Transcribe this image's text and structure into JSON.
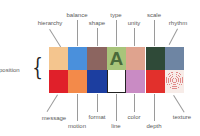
{
  "diagram": {
    "group_label": "composition",
    "group_label_visible": "mposition",
    "top_row": [
      {
        "label": "hierarchy",
        "color": "#f4c58e"
      },
      {
        "label": "balance",
        "color": "#4a90dc"
      },
      {
        "label": "shape",
        "color": "#8c6560"
      },
      {
        "label": "type",
        "color": "#a8c47a",
        "glyph": "A"
      },
      {
        "label": "unity",
        "color": "#dfa38e"
      },
      {
        "label": "scale",
        "color": "#2f4a38"
      },
      {
        "label": "rhythm",
        "color": "#6e85a3"
      }
    ],
    "bottom_row": [
      {
        "label": "message",
        "color": "#e0202a"
      },
      {
        "label": "motion",
        "color": "#f38a4a"
      },
      {
        "label": "format",
        "color": "#1c3ea0"
      },
      {
        "label": "line",
        "color": "#ffffff"
      },
      {
        "label": "color",
        "color": "#c98bc4"
      },
      {
        "label": "depth",
        "color": "#e2302c"
      },
      {
        "label": "texture",
        "color": "#f7ece8"
      }
    ]
  }
}
